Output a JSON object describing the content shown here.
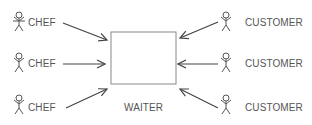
{
  "diagram": {
    "center": {
      "label": "WAITER"
    },
    "left_actors": [
      {
        "label": "CHEF"
      },
      {
        "label": "CHEF"
      },
      {
        "label": "CHEF"
      }
    ],
    "right_actors": [
      {
        "label": "CUSTOMER"
      },
      {
        "label": "CUSTOMER"
      },
      {
        "label": "CUSTOMER"
      }
    ],
    "colors": {
      "stroke": "#444444",
      "text": "#555555",
      "box": "#777777"
    }
  }
}
